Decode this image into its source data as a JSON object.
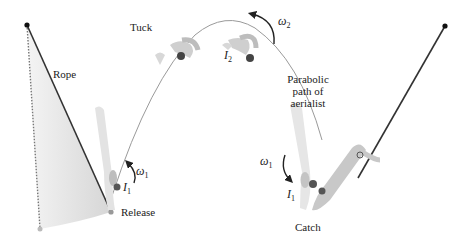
{
  "diagram": {
    "type": "physics-illustration",
    "labels": {
      "rope": "Rope",
      "tuck": "Tuck",
      "release": "Release",
      "catch": "Catch",
      "path_line1": "Parabolic",
      "path_line2": "path of",
      "path_line3": "aerialist"
    },
    "symbols": {
      "omega1_left": {
        "base": "ω",
        "sub": "1"
      },
      "I1_left": {
        "base": "I",
        "sub": "1"
      },
      "omega2": {
        "base": "ω",
        "sub": "2"
      },
      "I2": {
        "base": "I",
        "sub": "2"
      },
      "omega1_right": {
        "base": "ω",
        "sub": "1"
      },
      "I1_right": {
        "base": "I",
        "sub": "1"
      }
    },
    "colors": {
      "rope": "#333333",
      "path": "#9a9a9a",
      "swing_shade": "#d8d8d8",
      "figure": "#c8c8c8",
      "figure_dark": "#555555",
      "text": "#222222"
    }
  }
}
